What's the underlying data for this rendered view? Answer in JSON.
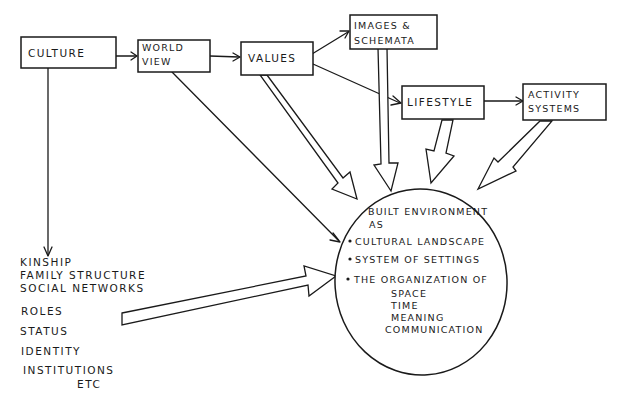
{
  "diagram": {
    "title": "",
    "nodes": {
      "culture": {
        "label": "CULTURE"
      },
      "world_view": {
        "line1": "WORLD",
        "line2": "VIEW"
      },
      "values": {
        "label": "VALUES"
      },
      "images_schemata": {
        "line1": "IMAGES &",
        "line2": "SCHEMATA"
      },
      "lifestyle": {
        "label": "LIFESTYLE"
      },
      "activity_systems": {
        "line1": "ACTIVITY",
        "line2": "SYSTEMS"
      }
    },
    "built_environment": {
      "heading1": "BUILT ENVIRONMENT",
      "heading2": "AS",
      "bullets": [
        "CULTURAL LANDSCAPE",
        "SYSTEM OF SETTINGS",
        "THE ORGANIZATION OF"
      ],
      "sub_items": [
        "SPACE",
        "TIME",
        "MEANING",
        "COMMUNICATION"
      ]
    },
    "social_list": {
      "items": [
        "KINSHIP",
        "FAMILY STRUCTURE",
        "SOCIAL NETWORKS",
        "ROLES",
        "STATUS",
        "IDENTITY",
        "INSTITUTIONS",
        "ETC"
      ]
    },
    "edges": [
      {
        "from": "CULTURE",
        "to": "WORLD VIEW",
        "style": "thin-arrow"
      },
      {
        "from": "WORLD VIEW",
        "to": "VALUES",
        "style": "thin-arrow"
      },
      {
        "from": "VALUES",
        "to": "IMAGES & SCHEMATA",
        "style": "thin-arrow"
      },
      {
        "from": "VALUES",
        "to": "LIFESTYLE",
        "style": "thin-arrow"
      },
      {
        "from": "LIFESTYLE",
        "to": "ACTIVITY SYSTEMS",
        "style": "thin-arrow"
      },
      {
        "from": "CULTURE",
        "to": "KINSHIP list",
        "style": "thin-arrow"
      },
      {
        "from": "WORLD VIEW",
        "to": "BUILT ENVIRONMENT",
        "style": "thin-arrow"
      },
      {
        "from": "VALUES",
        "to": "BUILT ENVIRONMENT",
        "style": "fat-arrow"
      },
      {
        "from": "IMAGES & SCHEMATA",
        "to": "BUILT ENVIRONMENT",
        "style": "fat-arrow"
      },
      {
        "from": "LIFESTYLE",
        "to": "BUILT ENVIRONMENT",
        "style": "fat-arrow"
      },
      {
        "from": "ACTIVITY SYSTEMS",
        "to": "BUILT ENVIRONMENT",
        "style": "fat-arrow"
      },
      {
        "from": "KINSHIP list",
        "to": "BUILT ENVIRONMENT",
        "style": "fat-arrow"
      }
    ],
    "colors": {
      "ink": "#1a1a1a",
      "paper": "#ffffff"
    }
  }
}
